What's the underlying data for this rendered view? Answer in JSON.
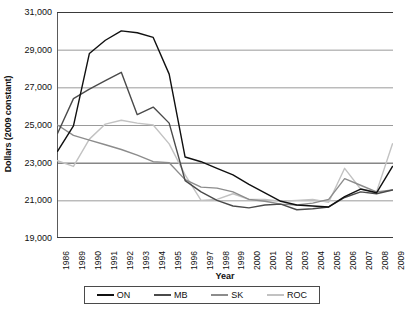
{
  "chart_data": {
    "type": "line",
    "title": "",
    "xlabel": "Year",
    "ylabel": "Dollars (2009 constant)",
    "ylim": [
      19000,
      31000
    ],
    "yticks": [
      19000,
      21000,
      23000,
      25000,
      27000,
      29000,
      31000
    ],
    "ytick_labels": [
      "19,000",
      "21,000",
      "23,000",
      "25,000",
      "27,000",
      "29,000",
      "31,000"
    ],
    "grid": true,
    "grid_axis": "y",
    "legend_position": "bottom",
    "categories": [
      "1986",
      "1989",
      "1990",
      "1991",
      "1992",
      "1993",
      "1994",
      "1995",
      "1996",
      "1997",
      "1998",
      "1999",
      "2000",
      "2001",
      "2002",
      "2003",
      "2004",
      "2005",
      "2006",
      "2007",
      "2008",
      "2009"
    ],
    "series": [
      {
        "name": "ON",
        "color": "#101010",
        "values": [
          23600,
          24950,
          28800,
          29500,
          30000,
          29900,
          29650,
          27700,
          23300,
          23050,
          22700,
          22350,
          21850,
          21400,
          20950,
          20750,
          20700,
          20650,
          21200,
          21600,
          21400,
          22800
        ]
      },
      {
        "name": "MB",
        "color": "#4a4a4a",
        "values": [
          24550,
          26400,
          26900,
          27350,
          27800,
          25550,
          25950,
          25100,
          22050,
          21450,
          21000,
          20700,
          20600,
          20750,
          20800,
          20500,
          20550,
          20650,
          21150,
          21450,
          21350,
          21550
        ]
      },
      {
        "name": "SK",
        "color": "#8c8c8c",
        "values": [
          25000,
          24450,
          24200,
          23950,
          23700,
          23400,
          23050,
          23000,
          22100,
          21700,
          21650,
          21450,
          21050,
          20950,
          20800,
          20750,
          20850,
          21050,
          22150,
          21800,
          21450,
          21550
        ]
      },
      {
        "name": "ROC",
        "color": "#c2c2c2",
        "values": [
          23100,
          22800,
          24250,
          25050,
          25250,
          25100,
          25000,
          24000,
          22350,
          21000,
          21050,
          21350,
          21050,
          21050,
          20950,
          21000,
          21050,
          20900,
          22700,
          21600,
          21450,
          24000
        ]
      }
    ]
  }
}
